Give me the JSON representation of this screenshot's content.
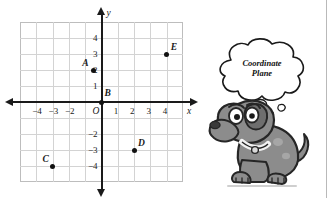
{
  "figure": {
    "kind": "coordinate-plane-diagram",
    "grid": {
      "x_min": -5,
      "x_max": 5,
      "y_min": -5,
      "y_max": 5,
      "step": 1,
      "grid_color": "#d3d3d3",
      "axis_color": "#1a1a1a",
      "border_color": "#bdbdbd"
    },
    "axes": {
      "x_name": "x",
      "y_name": "y",
      "origin_label": "O",
      "x_tick_labels": [
        {
          "value": -4,
          "text": "−4"
        },
        {
          "value": -3,
          "text": "−3"
        },
        {
          "value": -2,
          "text": "−2"
        },
        {
          "value": 1,
          "text": "1"
        },
        {
          "value": 2,
          "text": "2"
        },
        {
          "value": 3,
          "text": "3"
        },
        {
          "value": 4,
          "text": "4"
        }
      ],
      "y_tick_labels": [
        {
          "value": 4,
          "text": "4"
        },
        {
          "value": 3,
          "text": "3"
        },
        {
          "value": 2,
          "text": "2"
        },
        {
          "value": 1,
          "text": "1"
        },
        {
          "value": -2,
          "text": "−2"
        },
        {
          "value": -3,
          "text": "−3"
        },
        {
          "value": -4,
          "text": "−4"
        }
      ]
    },
    "points": [
      {
        "label": "A",
        "x": -0.5,
        "y": 2,
        "label_dx": -11,
        "label_dy": -11
      },
      {
        "label": "B",
        "x": 0,
        "y": 0,
        "label_dx": 3,
        "label_dy": -13
      },
      {
        "label": "C",
        "x": -3,
        "y": -4,
        "label_dx": -10,
        "label_dy": -11
      },
      {
        "label": "D",
        "x": 2,
        "y": -3,
        "label_dx": 4,
        "label_dy": -11
      },
      {
        "label": "E",
        "x": 4,
        "y": 3,
        "label_dx": 4,
        "label_dy": -11
      }
    ]
  },
  "mascot": {
    "name": "thinking-dog",
    "thought_line_1": "Coordinate",
    "thought_line_2": "Plane",
    "body_color": "#8c8c8c",
    "outline_color": "#262626"
  }
}
